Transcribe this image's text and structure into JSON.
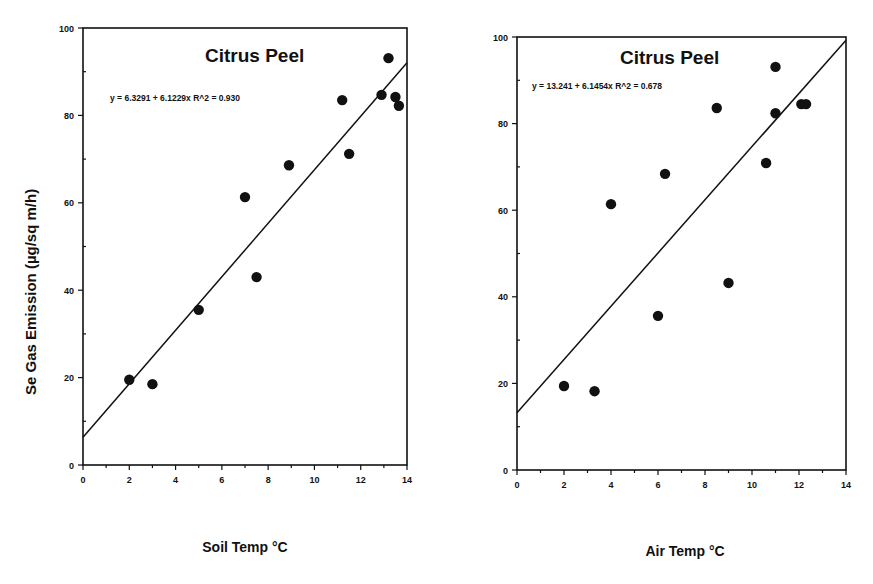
{
  "chart_data": [
    {
      "type": "scatter",
      "title": "Citrus Peel",
      "annotation": "y = 6.3291 + 6.1229x   R^2 = 0.930",
      "xlabel": "Soil Temp °C",
      "ylabel": "Se Gas Emission (µg/sq m/h)",
      "xlim": [
        0,
        14
      ],
      "ylim": [
        0,
        100
      ],
      "xticks": [
        0,
        2,
        4,
        6,
        8,
        10,
        12,
        14
      ],
      "yticks": [
        0,
        20,
        40,
        60,
        80,
        100
      ],
      "grid": false,
      "regression": {
        "intercept": 6.3291,
        "slope": 6.1229,
        "r2": 0.93
      },
      "points": [
        {
          "x": 2.0,
          "y": 19.5
        },
        {
          "x": 3.0,
          "y": 18.5
        },
        {
          "x": 5.0,
          "y": 35.5
        },
        {
          "x": 7.0,
          "y": 61.3
        },
        {
          "x": 7.5,
          "y": 43.0
        },
        {
          "x": 8.9,
          "y": 68.6
        },
        {
          "x": 11.2,
          "y": 83.5
        },
        {
          "x": 11.5,
          "y": 71.2
        },
        {
          "x": 12.9,
          "y": 84.7
        },
        {
          "x": 13.2,
          "y": 93.1
        },
        {
          "x": 13.5,
          "y": 84.2
        },
        {
          "x": 13.65,
          "y": 82.2
        }
      ]
    },
    {
      "type": "scatter",
      "title": "Citrus Peel",
      "annotation": "y = 13.241 + 6.1454x   R^2 = 0.678",
      "xlabel": "Air Temp °C",
      "ylabel": "",
      "xlim": [
        0,
        14
      ],
      "ylim": [
        0,
        100
      ],
      "xticks": [
        0,
        2,
        4,
        6,
        8,
        10,
        12,
        14
      ],
      "yticks": [
        0,
        20,
        40,
        60,
        80,
        100
      ],
      "grid": false,
      "regression": {
        "intercept": 13.241,
        "slope": 6.1454,
        "r2": 0.678
      },
      "points": [
        {
          "x": 2.0,
          "y": 19.4
        },
        {
          "x": 3.3,
          "y": 18.2
        },
        {
          "x": 4.0,
          "y": 61.4
        },
        {
          "x": 6.0,
          "y": 35.6
        },
        {
          "x": 6.3,
          "y": 68.4
        },
        {
          "x": 8.5,
          "y": 83.6
        },
        {
          "x": 9.0,
          "y": 43.2
        },
        {
          "x": 10.6,
          "y": 70.9
        },
        {
          "x": 11.0,
          "y": 93.1
        },
        {
          "x": 11.0,
          "y": 82.4
        },
        {
          "x": 12.1,
          "y": 84.5
        },
        {
          "x": 12.3,
          "y": 84.5
        }
      ]
    }
  ],
  "layout": {
    "charts": [
      {
        "x0": 83,
        "x1": 407,
        "y0": 465,
        "y1": 28,
        "title_x": 205,
        "title_y": 62,
        "eq_x": 110,
        "eq_y": 101,
        "xlabel_x": 245,
        "xlabel_y": 552
      },
      {
        "x0": 517,
        "x1": 846,
        "y0": 470,
        "y1": 37,
        "title_x": 620,
        "title_y": 64,
        "eq_x": 532,
        "eq_y": 89,
        "xlabel_x": 685,
        "xlabel_y": 556
      }
    ]
  },
  "colors": {
    "ink": "#111111",
    "background": "#ffffff"
  }
}
